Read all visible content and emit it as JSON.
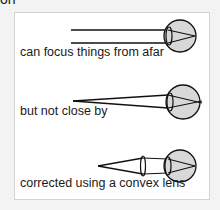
{
  "header": {
    "cut_text": "on"
  },
  "diagram": {
    "panels": [
      {
        "caption": "can focus things from afar",
        "scenario": "distant object, parallel rays focus on retina"
      },
      {
        "caption": "but not close by",
        "scenario": "near object, rays focus behind retina"
      },
      {
        "caption": "corrected using a convex lens",
        "scenario": "convex lens converges rays onto retina"
      }
    ],
    "colors": {
      "eye_fill": "#d8d8d8",
      "stroke": "#111111",
      "box_border": "#d4d4d4",
      "background": "#f3f3f3"
    }
  }
}
